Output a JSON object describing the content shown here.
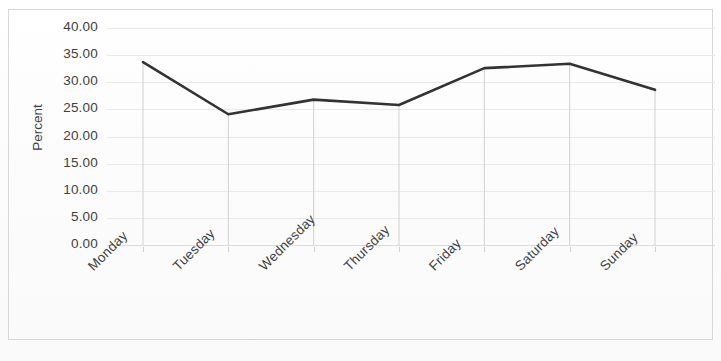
{
  "chart_data": {
    "type": "line",
    "title": "",
    "xlabel": "",
    "ylabel": "Percent",
    "categories": [
      "Monday",
      "Tuesday",
      "Wednesday",
      "Thursday",
      "Friday",
      "Saturday",
      "Sunday"
    ],
    "values": [
      33.7,
      24.1,
      26.8,
      25.8,
      32.6,
      33.4,
      28.6
    ],
    "series": [
      {
        "name": "Percent",
        "values": [
          33.7,
          24.1,
          26.8,
          25.8,
          32.6,
          33.4,
          28.6
        ]
      }
    ],
    "ylim": [
      0,
      40
    ],
    "ytick_step": 5,
    "ytick_labels": [
      "40.00",
      "35.00",
      "30.00",
      "25.00",
      "20.00",
      "15.00",
      "10.00",
      "5.00",
      "0.00"
    ],
    "ytick_values": [
      40,
      35,
      30,
      25,
      20,
      15,
      10,
      5,
      0
    ],
    "grid": true,
    "grid_axis": "y",
    "legend": false,
    "legend_position": "none",
    "markers": false,
    "drop_lines": true,
    "xlabel_rotation": -45,
    "line_color": "#333333",
    "grid_color": "#e9e9e9",
    "text_color": "#3f3f3f",
    "background_color": "#fdfdfd",
    "frame_color": "#d8d8d8"
  }
}
